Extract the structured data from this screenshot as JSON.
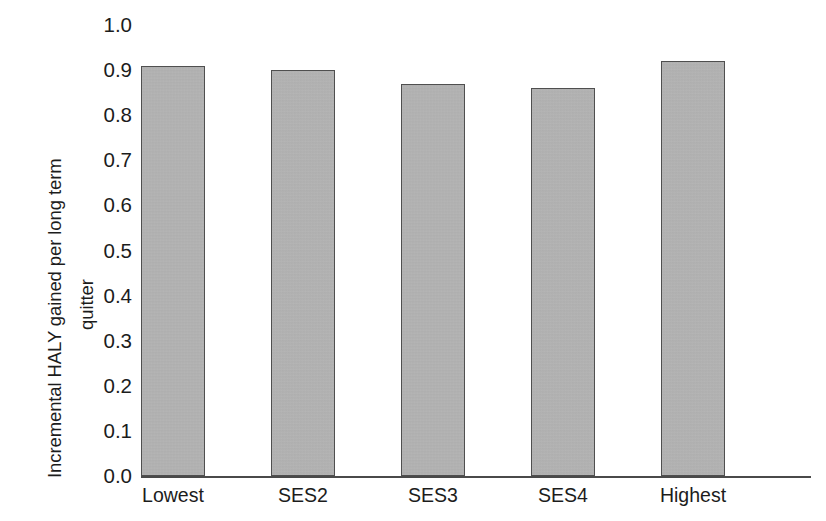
{
  "chart_data": {
    "type": "bar",
    "title": "",
    "xlabel": "",
    "ylabel_line1": "Incremental HALY gained per long term",
    "ylabel_line2": "quitter",
    "categories": [
      "Lowest",
      "SES2",
      "SES3",
      "SES4",
      "Highest"
    ],
    "values": [
      0.91,
      0.9,
      0.87,
      0.86,
      0.92
    ],
    "ylim": [
      0.0,
      1.0
    ],
    "ytick_labels": [
      "1.0",
      "0.9",
      "0.8",
      "0.7",
      "0.6",
      "0.5",
      "0.4",
      "0.3",
      "0.2",
      "0.1",
      "0.0"
    ],
    "ytick_values": [
      1.0,
      0.9,
      0.8,
      0.7,
      0.6,
      0.5,
      0.4,
      0.3,
      0.2,
      0.1,
      0.0
    ],
    "grid": false,
    "legend": false,
    "bar_fill_color": "#b2b2b2",
    "bar_border_color": "#4f4f4f",
    "axis_color": "#4a4a4a",
    "text_color": "#1c1c1c",
    "background_color": "#ffffff"
  }
}
